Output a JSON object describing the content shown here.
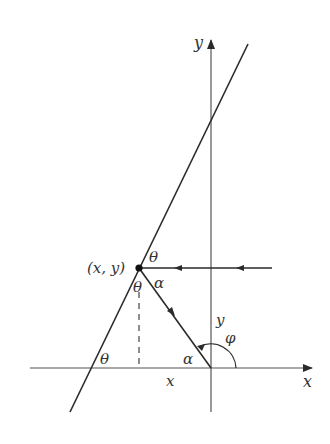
{
  "diagram": {
    "axes": {
      "x_label": "x",
      "y_label": "y"
    },
    "point_label": "(x, y)",
    "angle_labels": {
      "theta_top": "θ",
      "theta_mid": "θ",
      "theta_bottom": "θ",
      "alpha_top": "α",
      "alpha_bottom": "α",
      "phi": "φ"
    },
    "segment_labels": {
      "x_segment": "x",
      "y_segment": "y"
    },
    "colors": {
      "line": "#2a2a2a",
      "axis": "#555555",
      "background": "#ffffff"
    }
  }
}
